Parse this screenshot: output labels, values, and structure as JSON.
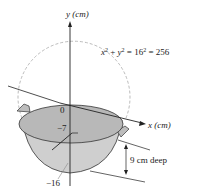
{
  "diagram": {
    "y_axis_label": "y (cm)",
    "x_axis_label": "x (cm)",
    "equation": {
      "lhs_x": "x",
      "lhs_y": "y",
      "sup2": "2",
      "rhs": "= 16",
      "rhs_end": "= 256"
    },
    "origin_label": "0",
    "inner_label": "−7",
    "bottom_label": "−16",
    "depth_label": "9 cm deep",
    "colors": {
      "bowl_fill": "#c8c8c8",
      "bowl_inner": "#b0b0b0",
      "line": "#222222",
      "dashed_circle": "#aaaaaa"
    }
  }
}
